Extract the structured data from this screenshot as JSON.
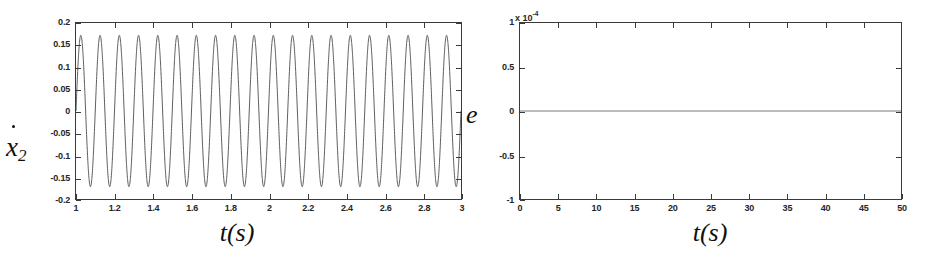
{
  "figure": {
    "background": "#ffffff",
    "line_color": "#4a4a4a",
    "axis_color": "#3a3a3a"
  },
  "panels": [
    {
      "id": "left",
      "y_axis_label": "x",
      "y_axis_label_sub": "2",
      "y_axis_label_accent": "dot",
      "x_axis_title_var": "t",
      "x_axis_title_open": "(",
      "x_axis_title_unit": "s",
      "x_axis_title_close": ")",
      "x_ticks": [
        "1",
        "1.2",
        "1.4",
        "1.6",
        "1.8",
        "2",
        "2.2",
        "2.4",
        "2.6",
        "2.8",
        "3"
      ],
      "y_ticks": [
        "0.2",
        "0.15",
        "0.1",
        "0.05",
        "0",
        "-0.05",
        "-0.1",
        "-0.15",
        "-0.2"
      ]
    },
    {
      "id": "right",
      "y_axis_label": "e",
      "exp_prefix": "x 10",
      "exp_power": "-4",
      "x_axis_title_var": "t",
      "x_axis_title_open": "(",
      "x_axis_title_unit": "s",
      "x_axis_title_close": ")",
      "x_ticks": [
        "0",
        "5",
        "10",
        "15",
        "20",
        "25",
        "30",
        "35",
        "40",
        "45",
        "50"
      ],
      "y_ticks": [
        "1",
        "0.5",
        "0",
        "-0.5",
        "-1"
      ]
    }
  ],
  "chart_data": [
    {
      "type": "line",
      "id": "left-velocity-plot",
      "title": "",
      "xlabel": "t(s)",
      "ylabel": "x2dot",
      "xlim": [
        1,
        3
      ],
      "ylim": [
        -0.2,
        0.2
      ],
      "xticks": [
        1,
        1.2,
        1.4,
        1.6,
        1.8,
        2,
        2.2,
        2.4,
        2.6,
        2.8,
        3
      ],
      "yticks": [
        -0.2,
        -0.15,
        -0.1,
        -0.05,
        0,
        0.05,
        0.1,
        0.15,
        0.2
      ],
      "grid": false,
      "legend": null,
      "series": [
        {
          "name": "x2dot",
          "waveform": "sine",
          "amplitude": 0.172,
          "frequency_hz": 10,
          "phase_rad": 0,
          "offset": 0,
          "cycles_visible": 20,
          "description": "steady-state sinusoidal velocity oscillation, constant amplitude across the 1 s to 3 s window"
        }
      ]
    },
    {
      "type": "line",
      "id": "right-error-plot",
      "title": "",
      "xlabel": "t(s)",
      "ylabel": "e",
      "y_scale_multiplier": "1e-4",
      "xlim": [
        0,
        50
      ],
      "ylim": [
        -1,
        1
      ],
      "xticks": [
        0,
        5,
        10,
        15,
        20,
        25,
        30,
        35,
        40,
        45,
        50
      ],
      "yticks": [
        -1,
        -0.5,
        0,
        0.5,
        1
      ],
      "grid": false,
      "legend": null,
      "series": [
        {
          "name": "e",
          "waveform": "constant",
          "value": 0,
          "description": "tracking error remains flat at zero across the full 0 s to 50 s window"
        }
      ]
    }
  ]
}
